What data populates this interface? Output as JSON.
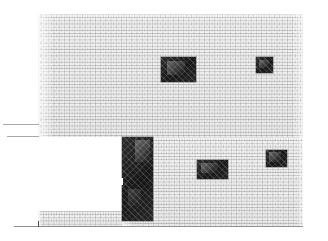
{
  "drawing": {
    "type": "architectural-elevation",
    "title": "Brick facade elevation",
    "canvas": {
      "width": 328,
      "height": 241
    },
    "background_color": "#ffffff",
    "line_color": "#8f8f8f",
    "brick_color": "#f0f0f0",
    "mortar_color": "#969696",
    "opening_color": "#1d1d1d"
  },
  "walls": [
    {
      "id": "main-wall",
      "label": "Main brick wall",
      "x": 38,
      "y": 14,
      "width": 265,
      "height": 123,
      "material": "brick-running-bond"
    },
    {
      "id": "right-wall",
      "label": "Right brick wall lower",
      "x": 122,
      "y": 137,
      "width": 181,
      "height": 89,
      "material": "brick-running-bond"
    },
    {
      "id": "plinth",
      "label": "Plinth brick course",
      "x": 38,
      "y": 211,
      "width": 85,
      "height": 15,
      "material": "brick-running-bond"
    }
  ],
  "openings": [
    {
      "id": "window-upper-left",
      "label": "Upper centre window",
      "x": 161,
      "y": 57,
      "width": 35,
      "height": 25
    },
    {
      "id": "window-upper-right",
      "label": "Upper right small window",
      "x": 256,
      "y": 57,
      "width": 17,
      "height": 16
    },
    {
      "id": "door",
      "label": "Entrance door",
      "x": 122,
      "y": 137,
      "width": 31,
      "height": 84
    },
    {
      "id": "window-lower-centre",
      "label": "Lower centre window",
      "x": 197,
      "y": 160,
      "width": 31,
      "height": 19
    },
    {
      "id": "window-lower-right",
      "label": "Lower right window",
      "x": 266,
      "y": 150,
      "width": 21,
      "height": 17
    }
  ],
  "door_reveal": {
    "x": 120,
    "y": 178,
    "width": 3,
    "height": 7
  },
  "datum_lines": [
    {
      "id": "datum-upper",
      "x": 3,
      "y": 124,
      "width": 36
    },
    {
      "id": "datum-lower",
      "x": 7,
      "y": 136,
      "width": 32
    }
  ],
  "ground_line": {
    "x": 14,
    "y": 226,
    "width": 289
  },
  "ground_tick": {
    "x": 38,
    "y": 221,
    "height": 6
  }
}
